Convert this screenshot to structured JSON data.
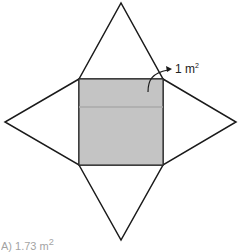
{
  "diagram": {
    "base": {
      "fill": "#c4c4c4",
      "label": "1 m",
      "label_sup": "2"
    },
    "stroke_color": "#1a1a1a"
  },
  "answer_option": {
    "text": "A)   1.73 m",
    "sup": "2"
  }
}
